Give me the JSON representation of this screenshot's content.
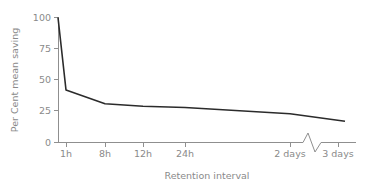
{
  "chart_data": {
    "type": "line",
    "title": "",
    "xlabel": "Retention interval",
    "ylabel": "Per Cent mean saving",
    "ylim": [
      0,
      100
    ],
    "yticks": [
      0,
      25,
      50,
      75,
      100
    ],
    "ytick_labels": [
      "0",
      "25",
      "50",
      "75",
      "100"
    ],
    "xtick_labels": [
      "1h",
      "8h",
      "12h",
      "24h",
      "2 days",
      "3 days"
    ],
    "xtick_positions_px": [
      66,
      105,
      143,
      185,
      290,
      338
    ],
    "grid": false,
    "legend": false,
    "axis_break": {
      "present": true,
      "between": [
        "2 days",
        "3 days"
      ],
      "shape": "zigzag"
    },
    "series": [
      {
        "name": "Per Cent mean saving",
        "points": [
          {
            "x_label": "0",
            "x_px": 58,
            "value": 100
          },
          {
            "x_label": "1h",
            "x_px": 66,
            "value": 42
          },
          {
            "x_label": "8h",
            "x_px": 105,
            "value": 31
          },
          {
            "x_label": "12h",
            "x_px": 143,
            "value": 29
          },
          {
            "x_label": "24h",
            "x_px": 185,
            "value": 28
          },
          {
            "x_label": "2 days",
            "x_px": 290,
            "value": 23
          },
          {
            "x_label": "3 days",
            "x_px": 345,
            "value": 17
          }
        ]
      }
    ],
    "colors": {
      "curve": "#2b2b2b",
      "axis": "#8f8f8f",
      "text": "#8a8a8a",
      "background": "#ffffff"
    }
  },
  "axis_titles": {
    "x": "Retention interval",
    "y": "Per Cent mean saving"
  },
  "y_labels": {
    "t0": "0",
    "t25": "25",
    "t50": "50",
    "t75": "75",
    "t100": "100"
  },
  "x_labels": {
    "t1": "1h",
    "t2": "8h",
    "t3": "12h",
    "t4": "24h",
    "t5": "2 days",
    "t6": "3 days"
  }
}
